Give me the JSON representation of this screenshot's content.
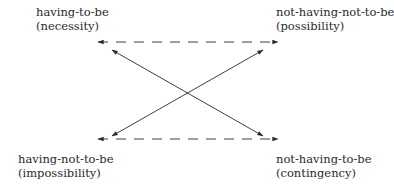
{
  "diagram": {
    "type": "square-of-opposition",
    "colors": {
      "ink": "#2a2a2a",
      "background": "#ffffff"
    },
    "corners": {
      "top_left": {
        "term": "having-to-be",
        "gloss": "(necessity)"
      },
      "top_right": {
        "term": "not-having-not-to-be",
        "gloss": "(possibility)"
      },
      "bottom_left": {
        "term": "having-not-to-be",
        "gloss": "(impossibility)"
      },
      "bottom_right": {
        "term": "not-having-to-be",
        "gloss": "(contingency)"
      }
    },
    "edges": [
      {
        "from": "top_left",
        "to": "top_right",
        "style": "dashed",
        "arrows": "both"
      },
      {
        "from": "bottom_left",
        "to": "bottom_right",
        "style": "dashed",
        "arrows": "both"
      },
      {
        "from": "top_left",
        "to": "bottom_right",
        "style": "solid",
        "arrows": "both"
      },
      {
        "from": "top_right",
        "to": "bottom_left",
        "style": "solid",
        "arrows": "both"
      }
    ]
  }
}
